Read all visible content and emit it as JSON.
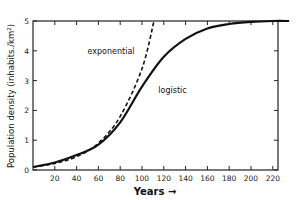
{
  "chart_data": {
    "type": "line",
    "title": "",
    "xlabel": "Years →",
    "ylabel": "Population density (inhabits./km²)",
    "xlim": [
      0,
      235
    ],
    "ylim": [
      0,
      5
    ],
    "x_ticks": [
      20,
      40,
      60,
      80,
      100,
      120,
      140,
      160,
      180,
      200,
      220
    ],
    "y_ticks": [
      0,
      1,
      2,
      3,
      4,
      5
    ],
    "grid": false,
    "legend": "inline annotations",
    "series": [
      {
        "name": "exponential",
        "style": "dashed",
        "x": [
          0,
          20,
          40,
          60,
          80,
          100,
          111
        ],
        "values": [
          0.1,
          0.22,
          0.45,
          0.9,
          1.8,
          3.4,
          5.0
        ]
      },
      {
        "name": "logistic",
        "style": "solid",
        "x": [
          0,
          20,
          40,
          60,
          80,
          100,
          120,
          140,
          160,
          180,
          200,
          220,
          235
        ],
        "values": [
          0.1,
          0.25,
          0.5,
          0.85,
          1.6,
          2.8,
          3.8,
          4.4,
          4.75,
          4.9,
          4.97,
          5.0,
          5.0
        ]
      }
    ],
    "annotations": [
      {
        "text": "exponential",
        "x": 50,
        "y": 3.9
      },
      {
        "text": "logistic",
        "x": 115,
        "y": 2.6
      }
    ]
  }
}
